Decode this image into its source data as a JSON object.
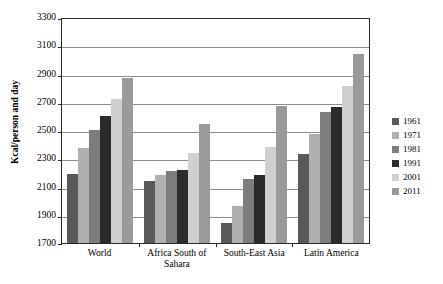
{
  "chart_data": {
    "type": "bar",
    "title": "",
    "xlabel": "",
    "ylabel": "Kcal/person and day",
    "ylim": [
      1700,
      3300
    ],
    "ytick_step": 200,
    "yticks": [
      1700,
      1900,
      2100,
      2300,
      2500,
      2700,
      2900,
      3100,
      3300
    ],
    "grid": true,
    "legend_position": "right",
    "categories": [
      "World",
      "Africa South of Sahara",
      "South-East Asia",
      "Latin America"
    ],
    "category_lines": [
      [
        "World"
      ],
      [
        "Africa South of",
        "Sahara"
      ],
      [
        "South-East Asia"
      ],
      [
        "Latin America"
      ]
    ],
    "series": [
      {
        "name": "1961",
        "color": "#595959",
        "values": [
          2190,
          2140,
          1840,
          2330
        ]
      },
      {
        "name": "1971",
        "color": "#b0b0b0",
        "values": [
          2370,
          2180,
          1960,
          2470
        ]
      },
      {
        "name": "1981",
        "color": "#7d7d7d",
        "values": [
          2500,
          2210,
          2150,
          2630
        ]
      },
      {
        "name": "1991",
        "color": "#2b2b2b",
        "values": [
          2600,
          2215,
          2180,
          2660
        ]
      },
      {
        "name": "2001",
        "color": "#cfcfcf",
        "values": [
          2720,
          2340,
          2380,
          2810
        ]
      },
      {
        "name": "2011",
        "color": "#9a9a9a",
        "values": [
          2870,
          2540,
          2670,
          3040
        ]
      }
    ]
  },
  "legend": {
    "items": [
      "1961",
      "1971",
      "1981",
      "1991",
      "2001",
      "2011"
    ]
  }
}
